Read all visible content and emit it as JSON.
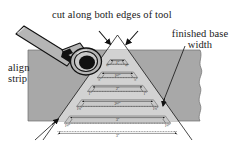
{
  "figure": {
    "type": "technical-woodworking-diagram",
    "background": "#ffffff",
    "colors": {
      "board_fill": "#a8a8a8",
      "triangle_fill": "#d2d2d2",
      "band_fill": "#c9c9c9",
      "line": "#1a1a1a",
      "tool_body": "#b5b5b5",
      "tool_dark": "#111111",
      "text": "#1a1a1a"
    }
  },
  "callouts": {
    "title": "cut along both edges of tool",
    "finished_base_width": "finished base width",
    "align_strip": "align strip"
  },
  "bands": [
    {
      "index": 0,
      "width_label": "1\"",
      "left_label": "½\"",
      "right_label": "½\""
    },
    {
      "index": 1,
      "width_label": "1½\"",
      "left_label": "¾\"",
      "right_label": "¾\""
    },
    {
      "index": 2,
      "width_label": "2\"",
      "left_label": "1\"",
      "right_label": "1\""
    },
    {
      "index": 3,
      "width_label": "2½\"",
      "left_label": "1¼\"",
      "right_label": "1¼\""
    },
    {
      "index": 4,
      "width_label": "3\"",
      "left_label": "1½\"",
      "right_label": "1½\""
    }
  ],
  "arrows": {
    "apex_left": "arrow pointing to left cut edge at apex",
    "apex_right": "arrow pointing to right cut edge at apex",
    "finished_base": "leader line from finished base width label",
    "align_strip": "leader line from align strip label"
  },
  "tool": {
    "name": "marking tool with round head",
    "position": "upper-left, angled across board corner"
  }
}
